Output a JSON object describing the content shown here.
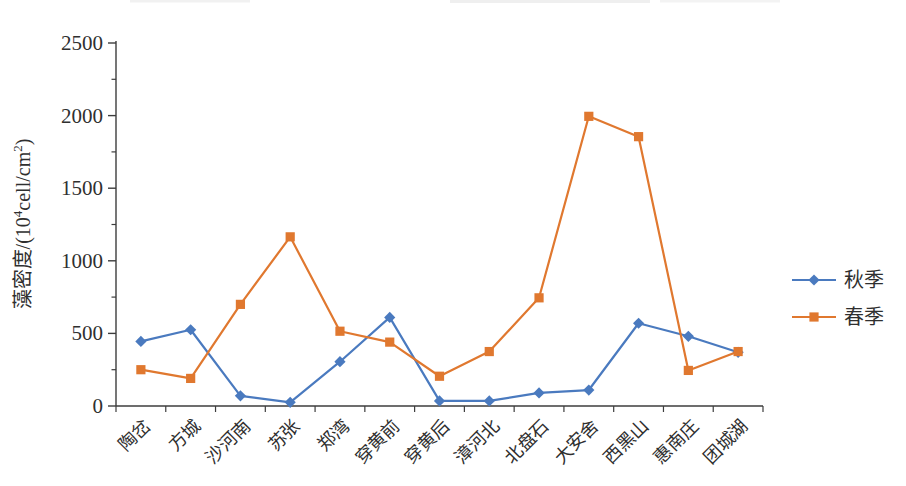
{
  "chart_data": {
    "type": "line",
    "title": "",
    "xlabel": "",
    "ylabel": "藻密度/(10⁴cell/cm²)",
    "ylabel_parts": [
      {
        "text": "藻密度/(10",
        "sup": false
      },
      {
        "text": "4",
        "sup": true
      },
      {
        "text": "cell/cm",
        "sup": false
      },
      {
        "text": "2",
        "sup": true
      },
      {
        "text": ")",
        "sup": false
      }
    ],
    "ylim": [
      0,
      2500
    ],
    "yticks": [
      0,
      500,
      1000,
      1500,
      2000,
      2500
    ],
    "ytick_minor_step": 250,
    "grid": false,
    "legend_position": "right-middle",
    "categories": [
      "陶岔",
      "方城",
      "沙河南",
      "苏张",
      "郑湾",
      "穿黄前",
      "穿黄后",
      "漳河北",
      "北盘石",
      "大安舍",
      "西黑山",
      "惠南庄",
      "团城湖"
    ],
    "series": [
      {
        "name": "秋季",
        "marker": "diamond",
        "color": "#4a7abf",
        "values": [
          445,
          525,
          70,
          25,
          305,
          610,
          35,
          35,
          90,
          110,
          570,
          480,
          370
        ]
      },
      {
        "name": "春季",
        "marker": "square",
        "color": "#e0782f",
        "values": [
          250,
          190,
          700,
          1165,
          515,
          440,
          205,
          375,
          745,
          1995,
          1855,
          245,
          375
        ]
      }
    ],
    "axis_color": "#3d3d3d",
    "text_color": "#2f2f2f"
  }
}
